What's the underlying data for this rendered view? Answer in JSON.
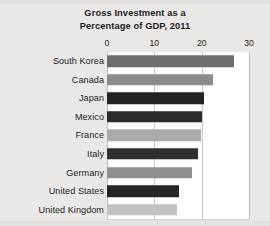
{
  "chart_data": {
    "type": "bar",
    "orientation": "horizontal",
    "title": "Gross Investment as a Percentage of GDP, 2011",
    "title_lines": [
      "Gross Investment as a",
      "Percentage of GDP, 2011"
    ],
    "xlabel": "",
    "ylabel": "",
    "xlim": [
      0,
      30
    ],
    "xticks": [
      0,
      10,
      20,
      30
    ],
    "xtick_labels": [
      "0",
      "10",
      "20",
      "30"
    ],
    "grid": true,
    "grid_axis": "x",
    "legend": false,
    "categories": [
      "South Korea",
      "Canada",
      "Japan",
      "Mexico",
      "France",
      "Italy",
      "Germany",
      "United States",
      "United Kingdom"
    ],
    "values": [
      26.8,
      22.3,
      20.5,
      20.0,
      19.8,
      19.3,
      18.0,
      15.2,
      14.8
    ],
    "bar_colors": [
      "#6d6d6d",
      "#8c8c8c",
      "#232323",
      "#2b2b2b",
      "#aaaaaa",
      "#2f2f2f",
      "#8f8f8f",
      "#262626",
      "#c2c2c2"
    ],
    "bars": [
      {
        "category": "South Korea",
        "value": 26.8,
        "color": "#6d6d6d"
      },
      {
        "category": "Canada",
        "value": 22.3,
        "color": "#8c8c8c"
      },
      {
        "category": "Japan",
        "value": 20.5,
        "color": "#232323"
      },
      {
        "category": "Mexico",
        "value": 20.0,
        "color": "#2b2b2b"
      },
      {
        "category": "France",
        "value": 19.8,
        "color": "#aaaaaa"
      },
      {
        "category": "Italy",
        "value": 19.3,
        "color": "#2f2f2f"
      },
      {
        "category": "Germany",
        "value": 18.0,
        "color": "#8f8f8f"
      },
      {
        "category": "United States",
        "value": 15.2,
        "color": "#262626"
      },
      {
        "category": "United Kingdom",
        "value": 14.8,
        "color": "#c2c2c2"
      }
    ],
    "plot_background": "#fdfdfc",
    "figure_background": "#e9e8e6",
    "gridline_color": "#c9c8c6",
    "text_color": "#1c1c1c"
  }
}
